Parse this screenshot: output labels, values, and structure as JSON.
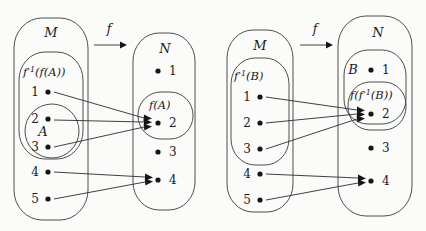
{
  "figure": {
    "title": "",
    "background_color": "#fbfbfa",
    "stroke_color": "#3a3a3a"
  },
  "panels": [
    {
      "id": "left-panel",
      "domain_set": {
        "name": "M",
        "label": "M",
        "elements": [
          "1",
          "2",
          "3",
          "4",
          "5"
        ]
      },
      "codomain_set": {
        "name": "N",
        "label": "N",
        "elements": [
          "1",
          "2",
          "3",
          "4"
        ]
      },
      "map_label": "f",
      "subsets": [
        {
          "id": "preimage-of-image",
          "label_main": "f",
          "label_sup": "-1",
          "label_rest": "(f(A))",
          "label_text": "f^-1(f(A))",
          "contains": [
            "1",
            "2",
            "3"
          ],
          "side": "domain"
        },
        {
          "id": "set-a",
          "label_main": "A",
          "label_sup": "",
          "label_rest": "",
          "label_text": "A",
          "contains": [
            "2",
            "3"
          ],
          "side": "domain"
        },
        {
          "id": "image-of-a",
          "label_main": "f",
          "label_sup": "",
          "label_rest": "(A)",
          "label_text": "f(A)",
          "contains": [
            "2"
          ],
          "side": "codomain"
        }
      ],
      "mappings": [
        {
          "from": "1",
          "to": "2"
        },
        {
          "from": "2",
          "to": "2"
        },
        {
          "from": "3",
          "to": "2"
        },
        {
          "from": "4",
          "to": "4"
        },
        {
          "from": "5",
          "to": "4"
        }
      ]
    },
    {
      "id": "right-panel",
      "domain_set": {
        "name": "M",
        "label": "M",
        "elements": [
          "1",
          "2",
          "3",
          "4",
          "5"
        ]
      },
      "codomain_set": {
        "name": "N",
        "label": "N",
        "elements": [
          "1",
          "2",
          "3",
          "4"
        ]
      },
      "map_label": "f",
      "subsets": [
        {
          "id": "preimage-of-b",
          "label_main": "f",
          "label_sup": "-1",
          "label_rest": "(B)",
          "label_text": "f^-1(B)",
          "contains": [
            "1",
            "2",
            "3"
          ],
          "side": "domain"
        },
        {
          "id": "set-b",
          "label_main": "B",
          "label_sup": "",
          "label_rest": "",
          "label_text": "B",
          "contains": [
            "1",
            "2"
          ],
          "side": "codomain"
        },
        {
          "id": "image-of-preimage-of-b",
          "label_main": "f",
          "label_sup": "",
          "label_rest": "(f^-1(B))",
          "label_text": "f(f^-1(B))",
          "contains": [
            "2"
          ],
          "side": "codomain"
        }
      ],
      "mappings": [
        {
          "from": "1",
          "to": "2"
        },
        {
          "from": "2",
          "to": "2"
        },
        {
          "from": "3",
          "to": "2"
        },
        {
          "from": "4",
          "to": "4"
        },
        {
          "from": "5",
          "to": "4"
        }
      ]
    }
  ],
  "text_tokens": {
    "M": "M",
    "N": "N",
    "A": "A",
    "B": "B",
    "f": "f",
    "one": "1",
    "two": "2",
    "three": "3",
    "four": "4",
    "five": "5",
    "minus_one": "-1",
    "f_open": "f",
    "paren_fA": "(f(A))",
    "paren_B": "(B)",
    "paren_A": "(A)",
    "paren_fiB": "(f",
    "paren_fiB_tail": "(B))"
  }
}
